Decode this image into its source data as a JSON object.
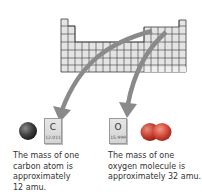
{
  "figure": {
    "periodic_table": {
      "description": "periodic-table-outline",
      "fill": "#e4e4e4",
      "grid": "#3a3a3a"
    },
    "arrow_color": "#8a8a8a",
    "carbon": {
      "symbol": "C",
      "mass": "12.011",
      "atom_color": "#3a3a3a",
      "caption_lines": [
        "The mass of one",
        "carbon atom is",
        "approximately",
        "12 amu."
      ]
    },
    "oxygen": {
      "symbol": "O",
      "mass": "15.999",
      "molecule_color": "#c43a2e",
      "caption_lines": [
        "The mass of one",
        "oxygen molecule is",
        "approximately 32 amu."
      ]
    }
  }
}
